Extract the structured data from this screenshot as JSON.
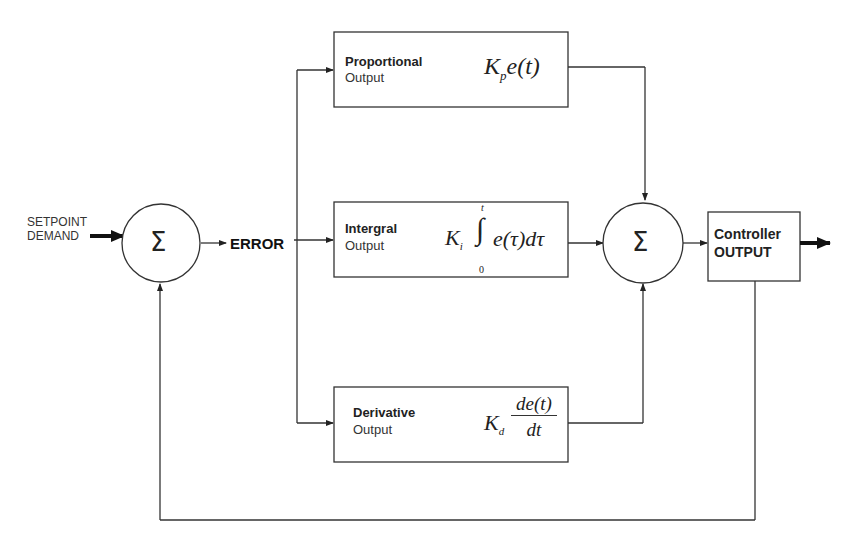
{
  "diagram": {
    "type": "PID controller block diagram",
    "input": {
      "line1": "SETPOINT",
      "line2": "DEMAND"
    },
    "summing_junction_1": {
      "symbol": "Σ"
    },
    "error_label": "ERROR",
    "blocks": {
      "proportional": {
        "title": "Proportional",
        "subtitle": "Output",
        "formula_K": "K",
        "formula_sub": "p",
        "formula_rest": "e(t)"
      },
      "integral": {
        "title": "Intergral",
        "subtitle": "Output",
        "formula_K": "K",
        "formula_sub": "i",
        "integral_sign": "∫",
        "upper_limit": "t",
        "lower_limit": "0",
        "formula_rest": "e(τ)dτ"
      },
      "derivative": {
        "title": "Derivative",
        "subtitle": "Output",
        "formula_K": "K",
        "formula_sub": "d",
        "numerator": "de(t)",
        "denominator": "dt"
      }
    },
    "summing_junction_2": {
      "symbol": "Σ"
    },
    "output_block": {
      "line1": "Controller",
      "line2": "OUTPUT"
    },
    "colors": {
      "line": "#333333",
      "background": "#ffffff"
    }
  }
}
